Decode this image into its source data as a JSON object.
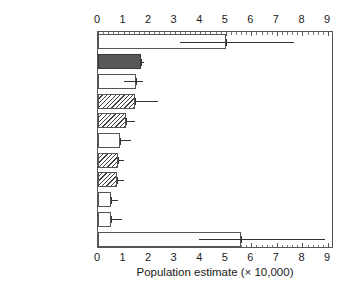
{
  "chart_data": {
    "type": "bar",
    "orientation": "horizontal",
    "title": "",
    "xlabel": "Population estimate (× 10,000)",
    "ylabel": "",
    "xlim": [
      0,
      9
    ],
    "xticks": [
      0,
      1,
      2,
      3,
      4,
      5,
      6,
      7,
      8,
      9
    ],
    "xticklabels": [
      "0",
      "1",
      "2",
      "3",
      "4",
      "5",
      "6",
      "7",
      "8",
      "9"
    ],
    "minor_ticks_per_interval": 4,
    "grid": false,
    "legend": null,
    "axis_top": true,
    "axis_bottom": true,
    "categories": [
      "GERMANY",
      "UKRAINE",
      "HUNGARY",
      "POLAND",
      "BELARUS",
      "FRANCE",
      "NETHERLANDS",
      "SWEDEN",
      "SPAIN",
      "ROMANIA",
      "Other countries"
    ],
    "values": [
      5.0,
      1.69,
      1.5,
      1.45,
      1.1,
      0.87,
      0.78,
      0.75,
      0.5,
      0.5,
      5.6
    ],
    "error_low": [
      3.2,
      1.69,
      1.0,
      1.45,
      1.1,
      0.87,
      0.78,
      0.75,
      0.5,
      0.5,
      3.95
    ],
    "error_high": [
      7.65,
      1.8,
      1.75,
      2.35,
      1.45,
      1.3,
      1.0,
      1.0,
      0.78,
      0.95,
      8.9
    ],
    "fill_styles": [
      "open",
      "solid-dark",
      "open",
      "hatch",
      "hatch",
      "open",
      "hatch",
      "hatch",
      "open",
      "open",
      "open"
    ]
  },
  "colors": {
    "solid_dark": "#58585a",
    "bar_edge": "#555555",
    "hatch_line": "#404040",
    "error_bar": "#333333",
    "text": "#1a1a1a",
    "background": "#ffffff"
  },
  "geometry": {
    "plot_left_px": 97,
    "plot_top_px": 31,
    "plot_width_px": 236,
    "plot_height_px": 217,
    "px_per_unit": 25.56
  }
}
